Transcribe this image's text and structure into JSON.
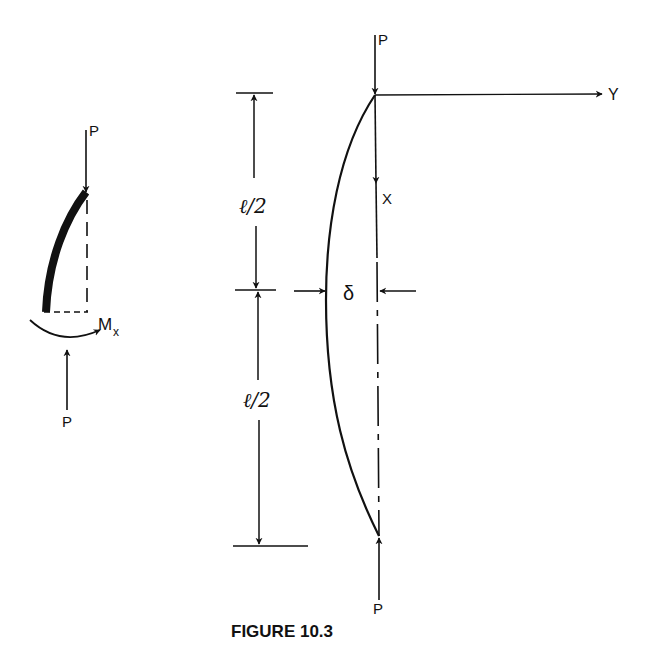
{
  "figure": {
    "caption": "FIGURE 10.3",
    "left_detail": {
      "load_top_label": "P",
      "load_bottom_label": "P",
      "moment_label": "M",
      "moment_subscript": "x"
    },
    "main_column": {
      "load_top_label": "P",
      "load_bottom_label": "P",
      "axis_y_label": "Y",
      "axis_x_label": "X",
      "deflection_label": "δ",
      "upper_half_length_label": "ℓ/2",
      "lower_half_length_label": "ℓ/2"
    }
  }
}
